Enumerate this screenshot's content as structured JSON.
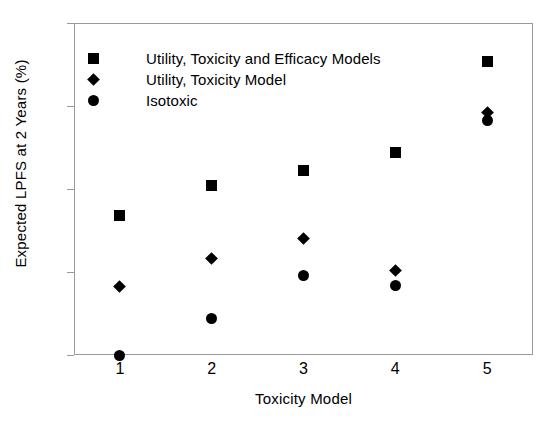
{
  "chart_data": {
    "type": "scatter",
    "title": "",
    "xlabel": "Toxicity Model",
    "ylabel": "Expected LPFS at 2 Years (%)",
    "x": [
      1,
      2,
      3,
      4,
      5
    ],
    "xtick_labels": [
      "1",
      "2",
      "3",
      "4",
      "5"
    ],
    "ytick_labels": [
      "40",
      "45",
      "50",
      "55",
      "60"
    ],
    "yticks": [
      40,
      45,
      50,
      55,
      60
    ],
    "xlim": [
      0.5,
      5.5
    ],
    "ylim": [
      40,
      60
    ],
    "grid": false,
    "legend_position": "top-left",
    "series": [
      {
        "name": "Utility, Toxicity and Efficacy Models",
        "marker": "square",
        "color": "#000000",
        "values": [
          48.4,
          50.2,
          51.1,
          52.2,
          57.7
        ]
      },
      {
        "name": "Utility, Toxicity Model",
        "marker": "diamond",
        "color": "#000000",
        "values": [
          44.1,
          45.8,
          47.0,
          45.1,
          54.6
        ]
      },
      {
        "name": "Isotoxic",
        "marker": "circle",
        "color": "#000000",
        "values": [
          40.0,
          42.2,
          44.8,
          44.2,
          54.1
        ]
      }
    ]
  },
  "axis_color": "#9a9a9a"
}
